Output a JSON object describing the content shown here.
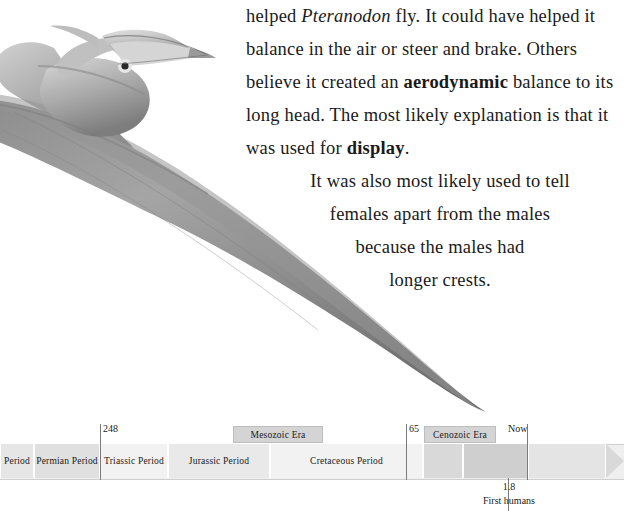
{
  "document": {
    "paragraph_1": {
      "segments": [
        {
          "text": "helped ",
          "style": "normal"
        },
        {
          "text": "Pteranodon",
          "style": "italic"
        },
        {
          "text": " fly. It could have helped it balance in the air or steer and brake. Others believe it created an ",
          "style": "normal"
        },
        {
          "text": "aerodynamic",
          "style": "bold"
        },
        {
          "text": " balance to its long head. The most likely explanation is that it was used for ",
          "style": "normal"
        },
        {
          "text": "display",
          "style": "bold"
        },
        {
          "text": ".",
          "style": "normal"
        }
      ]
    },
    "paragraph_2": {
      "line_1": "It was also most likely used to tell",
      "line_2": "females apart from the males",
      "line_3": "because the males had",
      "line_4": "longer crests."
    },
    "illustration": {
      "alt": "pteranodon-illustration"
    }
  },
  "timeline": {
    "periods": [
      {
        "label": "Period",
        "left": 0,
        "width": 34
      },
      {
        "label": "Permian Period",
        "left": 34,
        "width": 66
      },
      {
        "label": "Triassic Period",
        "left": 100,
        "width": 68
      },
      {
        "label": "Jurassic Period",
        "left": 168,
        "width": 102
      },
      {
        "label": "Cretaceous Period",
        "left": 270,
        "width": 153
      },
      {
        "label": "",
        "left": 423,
        "width": 40
      },
      {
        "label": "",
        "left": 463,
        "width": 65
      },
      {
        "label": "",
        "left": 528,
        "width": 78
      }
    ],
    "eras": [
      {
        "label": "Mesozoic Era",
        "left": 233,
        "width": 90
      },
      {
        "label": "Cenozoic Era",
        "left": 424,
        "width": 72
      }
    ],
    "markers": [
      {
        "label": "248",
        "left": 100,
        "label_left": 103,
        "label_top": 0
      },
      {
        "label": "65",
        "left": 406,
        "label_left": 409,
        "label_top": 0
      },
      {
        "label": "Now",
        "left": 527,
        "label_left": 510,
        "label_top": 0
      }
    ],
    "annotation": {
      "value": "1.8",
      "caption": "First humans"
    }
  }
}
